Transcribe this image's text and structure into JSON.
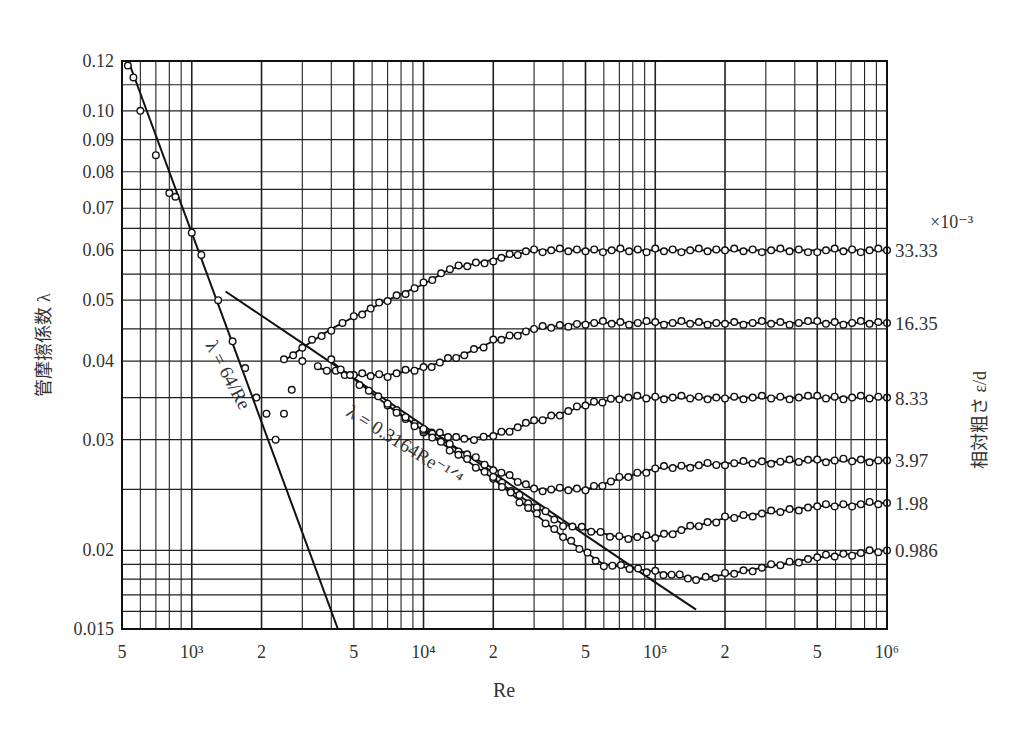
{
  "chart_data": {
    "type": "scatter",
    "title": "",
    "xlabel": "Re",
    "ylabel": "管摩擦係数 λ",
    "right_label": "相対粗さ ε/d",
    "right_multiplier": "×10⁻³",
    "x_scale": "log",
    "y_scale": "log",
    "xlim": [
      500,
      1000000
    ],
    "ylim": [
      0.015,
      0.12
    ],
    "grid": true,
    "x_ticks": [
      {
        "value": 500,
        "label": "5"
      },
      {
        "value": 1000,
        "label": "10³"
      },
      {
        "value": 2000,
        "label": "2"
      },
      {
        "value": 5000,
        "label": "5"
      },
      {
        "value": 10000,
        "label": "10⁴"
      },
      {
        "value": 20000,
        "label": "2"
      },
      {
        "value": 50000,
        "label": "5"
      },
      {
        "value": 100000,
        "label": "10⁵"
      },
      {
        "value": 200000,
        "label": "2"
      },
      {
        "value": 500000,
        "label": "5"
      },
      {
        "value": 1000000,
        "label": "10⁶"
      }
    ],
    "y_ticks": [
      {
        "value": 0.12,
        "label": "0.12"
      },
      {
        "value": 0.1,
        "label": "0.10"
      },
      {
        "value": 0.09,
        "label": "0.09"
      },
      {
        "value": 0.08,
        "label": "0.08"
      },
      {
        "value": 0.07,
        "label": "0.07"
      },
      {
        "value": 0.06,
        "label": "0.06"
      },
      {
        "value": 0.05,
        "label": "0.05"
      },
      {
        "value": 0.04,
        "label": "0.04"
      },
      {
        "value": 0.03,
        "label": "0.03"
      },
      {
        "value": 0.02,
        "label": "0.02"
      },
      {
        "value": 0.015,
        "label": "0.015"
      }
    ],
    "annotations": [
      {
        "text": "λ = 64/Re",
        "kind": "laminar-line",
        "rotation": 62
      },
      {
        "text": "λ = 0.3164Re⁻¹ᐟ⁴",
        "kind": "blasius-line",
        "rotation": 32
      }
    ],
    "reference_lines": [
      {
        "name": "Laminar λ=64/Re",
        "points": [
          [
            533,
            0.12
          ],
          [
            4270,
            0.015
          ]
        ]
      },
      {
        "name": "Blasius λ=0.3164Re^-0.25",
        "points": [
          [
            1400,
            0.0516
          ],
          [
            3000,
            0.0427
          ],
          [
            10000,
            0.0316
          ],
          [
            30000,
            0.024
          ],
          [
            100000,
            0.0178
          ],
          [
            150000,
            0.0161
          ]
        ]
      }
    ],
    "series": [
      {
        "name": "33.33",
        "relative_roughness": 0.03333,
        "x": [
          2500,
          3000,
          4000,
          5000,
          7000,
          10000,
          13000,
          20000,
          30000,
          50000,
          100000,
          200000,
          500000,
          1000000
        ],
        "y": [
          0.04,
          0.042,
          0.045,
          0.047,
          0.05,
          0.053,
          0.056,
          0.058,
          0.06,
          0.06,
          0.06,
          0.06,
          0.06,
          0.06
        ]
      },
      {
        "name": "16.35",
        "relative_roughness": 0.01635,
        "x": [
          3500,
          5000,
          7000,
          10000,
          15000,
          20000,
          30000,
          50000,
          100000,
          200000,
          500000,
          1000000
        ],
        "y": [
          0.039,
          0.038,
          0.038,
          0.039,
          0.041,
          0.043,
          0.045,
          0.046,
          0.046,
          0.046,
          0.046,
          0.046
        ]
      },
      {
        "name": "8.33",
        "relative_roughness": 0.00833,
        "x": [
          4000,
          7000,
          10000,
          15000,
          20000,
          30000,
          50000,
          70000,
          100000,
          200000,
          500000,
          1000000
        ],
        "y": [
          0.04,
          0.034,
          0.031,
          0.03,
          0.0305,
          0.032,
          0.034,
          0.035,
          0.035,
          0.035,
          0.035,
          0.035
        ]
      },
      {
        "name": "3.97",
        "relative_roughness": 0.00397,
        "x": [
          7000,
          10000,
          20000,
          30000,
          50000,
          70000,
          100000,
          200000,
          500000,
          1000000
        ],
        "y": [
          0.034,
          0.031,
          0.027,
          0.025,
          0.025,
          0.026,
          0.027,
          0.0275,
          0.0278,
          0.0278
        ]
      },
      {
        "name": "1.98",
        "relative_roughness": 0.00198,
        "x": [
          10000,
          20000,
          40000,
          70000,
          100000,
          200000,
          500000,
          1000000
        ],
        "y": [
          0.031,
          0.026,
          0.022,
          0.021,
          0.021,
          0.0225,
          0.0235,
          0.0238
        ]
      },
      {
        "name": "0.986",
        "relative_roughness": 0.000986,
        "x": [
          20000,
          40000,
          60000,
          100000,
          150000,
          200000,
          500000,
          1000000
        ],
        "y": [
          0.026,
          0.021,
          0.019,
          0.0185,
          0.018,
          0.0183,
          0.0195,
          0.02
        ]
      },
      {
        "name": "laminar-transition-data",
        "x": [
          530,
          560,
          600,
          700,
          800,
          850,
          1000,
          1100,
          1300,
          1500,
          1700,
          1900,
          2100,
          2300,
          2500,
          2700,
          3000
        ],
        "y": [
          0.118,
          0.113,
          0.1,
          0.085,
          0.074,
          0.073,
          0.064,
          0.059,
          0.05,
          0.043,
          0.039,
          0.035,
          0.033,
          0.03,
          0.033,
          0.036,
          0.04
        ]
      }
    ]
  }
}
